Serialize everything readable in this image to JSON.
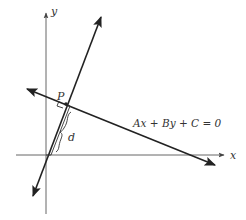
{
  "diagram": {
    "labels": {
      "y_axis": "y",
      "x_axis": "x",
      "point": "P",
      "distance": "d",
      "equation": "Ax + By + C = 0"
    },
    "colors": {
      "axis": "#555555",
      "line": "#222222",
      "text": "#333333"
    }
  }
}
